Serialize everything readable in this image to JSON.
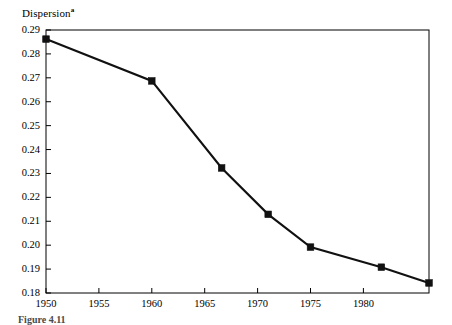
{
  "figure": {
    "y_axis_title": "Dispersion",
    "y_axis_title_footnote_mark": "a",
    "caption": "Figure 4.11"
  },
  "chart_data": {
    "type": "line",
    "title": "",
    "xlabel": "",
    "ylabel": "Dispersion",
    "ylabel_footnote": "a",
    "xlim": [
      1950,
      1986.2
    ],
    "ylim": [
      0.18,
      0.29
    ],
    "grid": false,
    "legend": null,
    "x_tick_labels": [
      "1950",
      "1955",
      "1960",
      "1965",
      "1970",
      "1975",
      "1980"
    ],
    "x_ticks": [
      1950,
      1955,
      1960,
      1965,
      1970,
      1975,
      1980
    ],
    "y_tick_labels": [
      "0.18",
      "0.19",
      "0.20",
      "0.21",
      "0.22",
      "0.23",
      "0.24",
      "0.25",
      "0.26",
      "0.27",
      "0.28",
      "0.29"
    ],
    "y_ticks": [
      0.18,
      0.19,
      0.2,
      0.21,
      0.22,
      0.23,
      0.24,
      0.25,
      0.26,
      0.27,
      0.28,
      0.29
    ],
    "series": [
      {
        "name": "Dispersion",
        "marker": "filled-square",
        "color": "#111111",
        "x": [
          1950,
          1960,
          1966.6,
          1971,
          1975,
          1981.7,
          1986.2
        ],
        "y": [
          0.2862,
          0.2687,
          0.2323,
          0.2129,
          0.1992,
          0.1908,
          0.1842
        ]
      }
    ]
  }
}
